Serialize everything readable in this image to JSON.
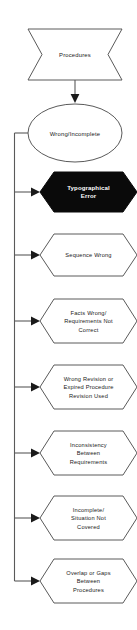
{
  "diagram": {
    "orientation": "vertical",
    "line_color": "#5a5a5a",
    "text_color": "#1a1a1a",
    "background_color": "#ffffff",
    "highlight_fill": "#0a0a0a",
    "highlight_text_color": "#ffffff"
  },
  "start_node": {
    "id": "procedures",
    "shape": "ribbon",
    "label": "Procedures"
  },
  "decision_node": {
    "id": "wrong-incomplete",
    "shape": "ellipse",
    "label": "Wrong/Incomplete"
  },
  "branches": [
    {
      "id": "typographical-error",
      "shape": "hexagon",
      "highlighted": true,
      "lines": [
        "Typographical",
        "Error"
      ],
      "label": "Typographical Error"
    },
    {
      "id": "sequence-wrong",
      "shape": "hexagon",
      "highlighted": false,
      "lines": [
        "Sequence Wrong"
      ],
      "label": "Sequence Wrong"
    },
    {
      "id": "facts-wrong",
      "shape": "hexagon",
      "highlighted": false,
      "lines": [
        "Facts Wrong/",
        "Requirements Not",
        "Correct"
      ],
      "label": "Facts Wrong/ Requirements Not Correct"
    },
    {
      "id": "wrong-revision",
      "shape": "hexagon",
      "highlighted": false,
      "lines": [
        "Wrong Revision or",
        "Expired Procedure",
        "Revision Used"
      ],
      "label": "Wrong Revision or Expired Procedure Revision Used"
    },
    {
      "id": "inconsistency",
      "shape": "hexagon",
      "highlighted": false,
      "lines": [
        "Inconsistency",
        "Between",
        "Requirements"
      ],
      "label": "Inconsistency Between Requirements"
    },
    {
      "id": "incomplete-situation",
      "shape": "hexagon",
      "highlighted": false,
      "lines": [
        "Incomplete/",
        "Situation Not",
        "Covered"
      ],
      "label": "Incomplete/ Situation Not Covered"
    },
    {
      "id": "overlap-gaps",
      "shape": "hexagon",
      "highlighted": false,
      "lines": [
        "Overlap or Gaps",
        "Between",
        "Procedures"
      ],
      "label": "Overlap or Gaps Between Procedures"
    }
  ]
}
